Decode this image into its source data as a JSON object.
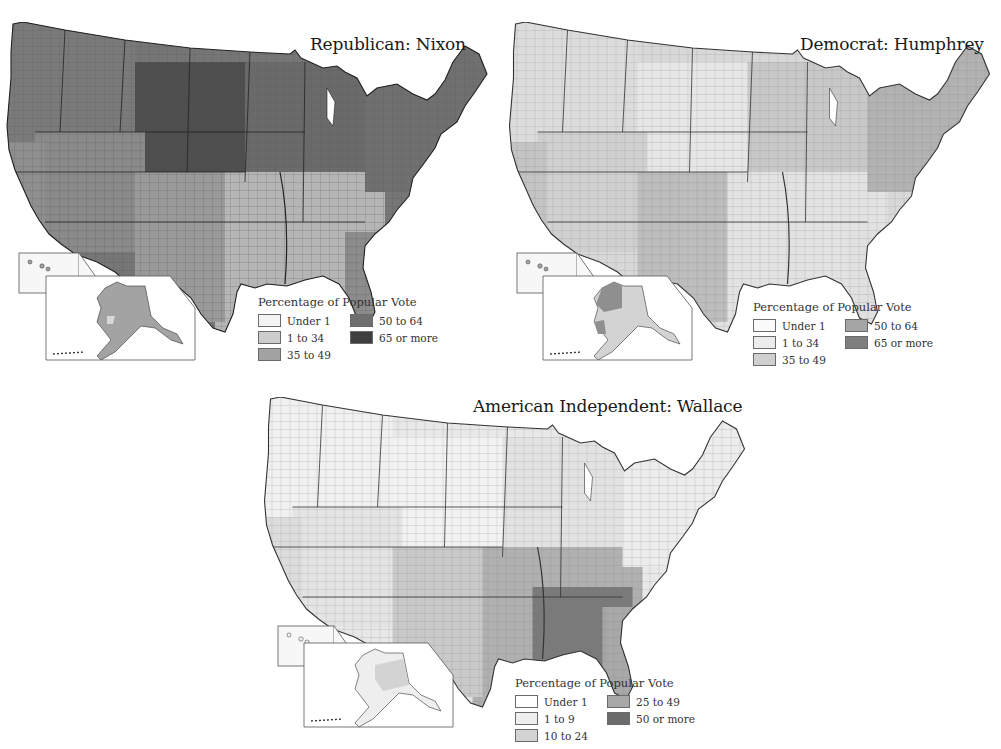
{
  "maps": [
    {
      "id": "nixon",
      "title": "Republican: Nixon",
      "legend": {
        "title": "Percentage of Popular Vote",
        "items": [
          {
            "label": "Under 1",
            "color": "#f4f4f4"
          },
          {
            "label": "1 to 34",
            "color": "#cdcdcd"
          },
          {
            "label": "35 to 49",
            "color": "#a3a3a3"
          },
          {
            "label": "50 to 64",
            "color": "#6f6f6f"
          },
          {
            "label": "65 or more",
            "color": "#3f3f3f"
          }
        ]
      },
      "regional_shading": {
        "northwest": "#7a7a7a",
        "plains": "#4e4e4e",
        "southwest": "#8a8a8a",
        "midwest": "#6a6a6a",
        "south": "#b5b5b5",
        "northeast": "#707070",
        "texas": "#9a9a9a",
        "florida": "#8c8c8c",
        "california": "#8f8f8f",
        "alaska": "#a3a3a3",
        "hawaii": "#a3a3a3"
      }
    },
    {
      "id": "humphrey",
      "title": "Democrat: Humphrey",
      "legend": {
        "title": "Percentage of Popular Vote",
        "items": [
          {
            "label": "Under 1",
            "color": "#fbfbfb"
          },
          {
            "label": "1 to 34",
            "color": "#ececec"
          },
          {
            "label": "35 to 49",
            "color": "#cfcfcf"
          },
          {
            "label": "50 to 64",
            "color": "#a5a5a5"
          },
          {
            "label": "65 or more",
            "color": "#7f7f7f"
          }
        ]
      },
      "regional_shading": {
        "northwest": "#dcdcdc",
        "plains": "#e6e6e6",
        "southwest": "#d0d0d0",
        "midwest": "#c8c8c8",
        "south": "#e2e2e2",
        "northeast": "#b2b2b2",
        "texas": "#bdbdbd",
        "florida": "#e0e0e0",
        "california": "#c4c4c4",
        "alaska": "#cfcfcf",
        "hawaii": "#a5a5a5"
      }
    },
    {
      "id": "wallace",
      "title": "American Independent: Wallace",
      "legend": {
        "title": "Percentage of Popular Vote",
        "items": [
          {
            "label": "Under 1",
            "color": "#ffffff"
          },
          {
            "label": "1 to 9",
            "color": "#eeeeee"
          },
          {
            "label": "10 to 24",
            "color": "#d3d3d3"
          },
          {
            "label": "25 to 49",
            "color": "#a8a8a8"
          },
          {
            "label": "50 or more",
            "color": "#6c6c6c"
          }
        ]
      },
      "regional_shading": {
        "northwest": "#f0f0f0",
        "plains": "#f2f2f2",
        "southwest": "#e4e4e4",
        "midwest": "#e8e8e8",
        "south": "#7a7a7a",
        "northeast": "#ececec",
        "texas": "#c9c9c9",
        "florida": "#a8a8a8",
        "california": "#dcdcdc",
        "alaska": "#d3d3d3",
        "hawaii": "#f4f4f4"
      }
    }
  ]
}
